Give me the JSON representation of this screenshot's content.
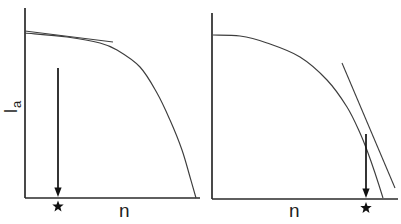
{
  "figure": {
    "background": "#ffffff",
    "axis_color": "#2a2a2a",
    "curve_color": "#3d3d3d",
    "marker_color": "#111111",
    "y_axis_label": {
      "base": "I",
      "subscript": "a"
    },
    "panels": [
      {
        "id": "left",
        "x_axis_label": "n",
        "axes": {
          "origin_x": 25,
          "origin_y": 198,
          "y_top": 8,
          "x_right": 200
        },
        "curve": [
          [
            25,
            33
          ],
          [
            67,
            37
          ],
          [
            100,
            43
          ],
          [
            117,
            50
          ],
          [
            140,
            67
          ],
          [
            157,
            93
          ],
          [
            170,
            120
          ],
          [
            182,
            150
          ],
          [
            190,
            177
          ],
          [
            196,
            198
          ]
        ],
        "tangent": {
          "x1": 25,
          "y1": 31,
          "x2": 113,
          "y2": 42
        },
        "arrow": {
          "x": 58,
          "y_top": 68,
          "y_tip": 197
        },
        "star": {
          "x": 58,
          "y": 206.5,
          "size": 6
        }
      },
      {
        "id": "right",
        "x_axis_label": "n",
        "axes": {
          "origin_x": 212,
          "origin_y": 199,
          "y_top": 13,
          "x_right": 398
        },
        "curve": [
          [
            213,
            35
          ],
          [
            240,
            36
          ],
          [
            267,
            43
          ],
          [
            300,
            57
          ],
          [
            327,
            80
          ],
          [
            347,
            107
          ],
          [
            360,
            133
          ],
          [
            368,
            153
          ],
          [
            375,
            173
          ],
          [
            383,
            198
          ]
        ],
        "tangent": {
          "x1": 342,
          "y1": 63,
          "x2": 395,
          "y2": 188
        },
        "arrow": {
          "x": 366,
          "y_top": 134,
          "y_tip": 198
        },
        "star": {
          "x": 366,
          "y": 208,
          "size": 6
        }
      }
    ]
  },
  "chart_data": [
    {
      "type": "line",
      "title": "",
      "xlabel": "n",
      "ylabel": "Ia",
      "x": [
        0.0,
        0.24,
        0.43,
        0.53,
        0.66,
        0.75,
        0.83,
        0.9,
        0.94,
        0.98
      ],
      "series": [
        {
          "name": "Ia vs n (left panel)",
          "values": [
            1.0,
            0.98,
            0.94,
            0.9,
            0.79,
            0.64,
            0.47,
            0.29,
            0.13,
            0.0
          ]
        }
      ],
      "xlim": [
        0,
        1
      ],
      "ylim": [
        0,
        1
      ],
      "grid": false,
      "legend": false,
      "notes": "Qualitative sketch; axes have no tick labels, values normalized 0-1",
      "annotations": [
        {
          "type": "tangent-line",
          "description": "tangent drawn to the initial flat part of the curve, starting at the y-axis"
        },
        {
          "type": "arrow-down",
          "x": 0.19,
          "description": "vertical arrow pointing down to a star marker on the n axis"
        },
        {
          "type": "star-marker",
          "x": 0.19,
          "y": 0
        }
      ]
    },
    {
      "type": "line",
      "title": "",
      "xlabel": "n",
      "ylabel": "",
      "x": [
        0.0,
        0.15,
        0.3,
        0.47,
        0.62,
        0.73,
        0.8,
        0.84,
        0.88,
        0.92
      ],
      "series": [
        {
          "name": "Ia vs n (right panel)",
          "values": [
            1.0,
            0.99,
            0.95,
            0.87,
            0.73,
            0.56,
            0.4,
            0.28,
            0.16,
            0.0
          ]
        }
      ],
      "xlim": [
        0,
        1
      ],
      "ylim": [
        0,
        1
      ],
      "grid": false,
      "legend": false,
      "notes": "Qualitative sketch; axes have no tick labels, values normalized 0-1",
      "annotations": [
        {
          "type": "tangent-line",
          "description": "tangent drawn to the steep descending part of the curve, extending below the axis region"
        },
        {
          "type": "arrow-down",
          "x": 0.83,
          "description": "vertical arrow pointing down to a star marker on the n axis"
        },
        {
          "type": "star-marker",
          "x": 0.83,
          "y": 0
        }
      ]
    }
  ]
}
